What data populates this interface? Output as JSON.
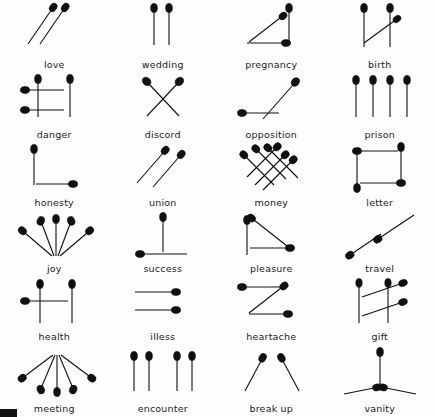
{
  "page": {
    "background_color": "#fefefe",
    "ink_color": "#101010",
    "stick_color": "#8a8a8a",
    "columns": 4,
    "rows": 6,
    "corner_mark": "black-rectangle"
  },
  "symbols": [
    {
      "id": "love",
      "label": "love",
      "arrangement": "two parallel diagonal matches, heads upper-right"
    },
    {
      "id": "wedding",
      "label": "wedding",
      "arrangement": "two parallel vertical matches, heads up"
    },
    {
      "id": "pregnancy",
      "label": "pregnancy",
      "arrangement": "right triangle: vertical right, horizontal bottom, diagonal hypotenuse"
    },
    {
      "id": "birth",
      "label": "birth",
      "arrangement": "two verticals with a diagonal match between them"
    },
    {
      "id": "danger",
      "label": "danger",
      "arrangement": "two verticals crossed by two horizontal bars, heads left"
    },
    {
      "id": "discord",
      "label": "discord",
      "arrangement": "two matches crossed in an X"
    },
    {
      "id": "opposition",
      "label": "opposition",
      "arrangement": "a horizontal match and a diagonal match meeting at an angle"
    },
    {
      "id": "prison",
      "label": "prison",
      "arrangement": "four vertical matches in a row, heads up"
    },
    {
      "id": "honesty",
      "label": "honesty",
      "arrangement": "one vertical and one horizontal forming an L"
    },
    {
      "id": "union",
      "label": "union",
      "arrangement": "two parallel diagonal matches, heads upper-right"
    },
    {
      "id": "money",
      "label": "money",
      "arrangement": "six matches woven into a lattice grid"
    },
    {
      "id": "letter",
      "label": "letter",
      "arrangement": "four matches forming a closed rectangle"
    },
    {
      "id": "joy",
      "label": "joy",
      "arrangement": "five matches fanned upward, heads outward"
    },
    {
      "id": "success",
      "label": "success",
      "arrangement": "one vertical standing on one horizontal base"
    },
    {
      "id": "pleasure",
      "label": "pleasure",
      "arrangement": "vertical, horizontal and diagonal forming a triangle"
    },
    {
      "id": "travel",
      "label": "travel",
      "arrangement": "two matches end to end along one long diagonal"
    },
    {
      "id": "health",
      "label": "health",
      "arrangement": "two verticals joined by a horizontal crossbar, letter H"
    },
    {
      "id": "illess",
      "label": "illess",
      "arrangement": "two horizontal parallel matches, heads right"
    },
    {
      "id": "heartache",
      "label": "heartache",
      "arrangement": "three matches forming a zig-zag Z"
    },
    {
      "id": "gift",
      "label": "gift",
      "arrangement": "two verticals crossed by two slanted bars"
    },
    {
      "id": "meeting",
      "label": "meeting",
      "arrangement": "five matches fanned downward, heads outward"
    },
    {
      "id": "encounter",
      "label": "encounter",
      "arrangement": "two pairs of vertical matches separated by a gap"
    },
    {
      "id": "break up",
      "label": "break up",
      "arrangement": "two diagonal matches splaying apart, heads at top"
    },
    {
      "id": "vanity",
      "label": "vanity",
      "arrangement": "one vertical over two diagonals meeting at a point"
    }
  ]
}
